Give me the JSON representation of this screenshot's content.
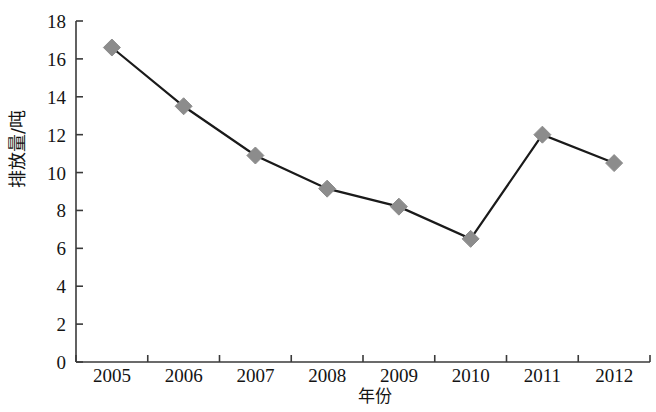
{
  "chart_data": {
    "type": "line",
    "title": "",
    "xlabel": "年份",
    "ylabel": "排放量/吨",
    "categories": [
      "2005",
      "2006",
      "2007",
      "2008",
      "2009",
      "2010",
      "2011",
      "2012"
    ],
    "values": [
      16.6,
      13.5,
      10.9,
      9.15,
      8.2,
      6.5,
      12.0,
      10.5
    ],
    "series": [
      {
        "name": "排放量/吨",
        "values": [
          16.6,
          13.5,
          10.9,
          9.15,
          8.2,
          6.5,
          12.0,
          10.5
        ]
      }
    ],
    "ylim": [
      0,
      18
    ],
    "yticks": [
      "0",
      "2",
      "4",
      "6",
      "8",
      "10",
      "12",
      "14",
      "16",
      "18"
    ],
    "ytick_values": [
      0,
      2,
      4,
      6,
      8,
      10,
      12,
      14,
      16,
      18
    ],
    "xticks": [
      "2005",
      "2006",
      "2007",
      "2008",
      "2009",
      "2010",
      "2011",
      "2012"
    ],
    "grid": false,
    "legend": "none",
    "marker": "diamond",
    "line_color": "#1a1a1a",
    "marker_color": "#8c8c8c",
    "marker_edge_color": "#8c8c8c",
    "axis_color": "#3a3a3a",
    "background_color": "#ffffff"
  }
}
